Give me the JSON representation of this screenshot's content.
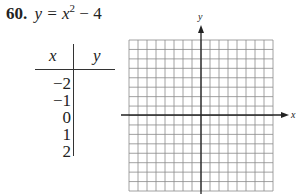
{
  "problem": {
    "number": "60.",
    "equation_lhs": "y = x",
    "equation_exp": "2",
    "equation_rest": " − 4"
  },
  "table": {
    "header_x": "x",
    "header_y": "y",
    "x_values": [
      "−2",
      "−1",
      "0",
      "1",
      "2"
    ],
    "y_values": [
      "",
      "",
      "",
      "",
      ""
    ]
  },
  "graph": {
    "x_axis_label": "x",
    "y_axis_label": "y",
    "grid_columns": 16,
    "grid_rows": 16
  }
}
